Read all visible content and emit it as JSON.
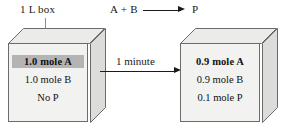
{
  "figure": {
    "container_label": "1 L box",
    "duration_label": "1 minute",
    "equation": {
      "reactants": "A + B",
      "product": "P",
      "arrow_icon": "right-arrow-icon"
    }
  },
  "boxes": [
    {
      "position": "left",
      "state": "initial",
      "rows": [
        {
          "text": "1.0 mole A",
          "bold": true,
          "highlighted": true
        },
        {
          "text": "1.0 mole B",
          "bold": false,
          "highlighted": false
        },
        {
          "text": "No P",
          "bold": false,
          "highlighted": false
        }
      ]
    },
    {
      "position": "right",
      "state": "after-1-minute",
      "rows": [
        {
          "text": "0.9 mole A",
          "bold": true,
          "highlighted": false
        },
        {
          "text": "0.9 mole B",
          "bold": false,
          "highlighted": false
        },
        {
          "text": "0.1 mole P",
          "bold": false,
          "highlighted": false
        }
      ]
    }
  ],
  "colors": {
    "front_face": "#f2f2f0",
    "top_face": "#ebebe9",
    "side_face": "#dcdcda",
    "outline": "#6b6b6b",
    "highlight": "#b4b4b4",
    "text": "#111111"
  }
}
